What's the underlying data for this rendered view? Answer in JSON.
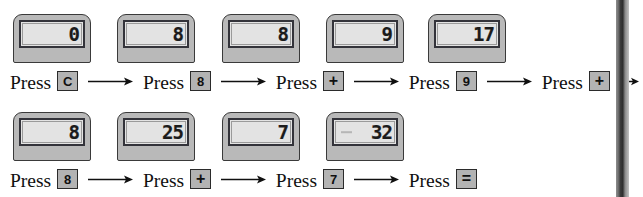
{
  "figure": {
    "arrow_label": "arrow-right",
    "press_word": "Press",
    "colors": {
      "bezel": "#b9b9b9",
      "screen": "#e3e3e3",
      "screen_border": "#33333a",
      "keycap": "#b3b3b3",
      "ink": "#101010",
      "page_edge": "#2e2e2e"
    }
  },
  "rows": [
    {
      "id": "row-1",
      "steps": [
        {
          "display": "0",
          "press_word": "Press",
          "key": "C",
          "key_name": "clear-key",
          "arrow_after": true
        },
        {
          "display": "8",
          "press_word": "Press",
          "key": "8",
          "key_name": "digit-8-key",
          "arrow_after": true
        },
        {
          "display": "8",
          "press_word": "Press",
          "key": "+",
          "key_name": "plus-key",
          "arrow_after": true
        },
        {
          "display": "9",
          "press_word": "Press",
          "key": "9",
          "key_name": "digit-9-key",
          "arrow_after": true
        },
        {
          "display": "17",
          "press_word": "Press",
          "key": "+",
          "key_name": "plus-key",
          "arrow_after": true
        }
      ]
    },
    {
      "id": "row-2",
      "steps": [
        {
          "display": "8",
          "press_word": "Press",
          "key": "8",
          "key_name": "digit-8-key",
          "arrow_after": true
        },
        {
          "display": "25",
          "press_word": "Press",
          "key": "+",
          "key_name": "plus-key",
          "arrow_after": true
        },
        {
          "display": "7",
          "press_word": "Press",
          "key": "7",
          "key_name": "digit-7-key",
          "arrow_after": true
        },
        {
          "display": "32",
          "press_word": "Press",
          "key": "=",
          "key_name": "equals-key",
          "arrow_after": false
        }
      ]
    }
  ]
}
